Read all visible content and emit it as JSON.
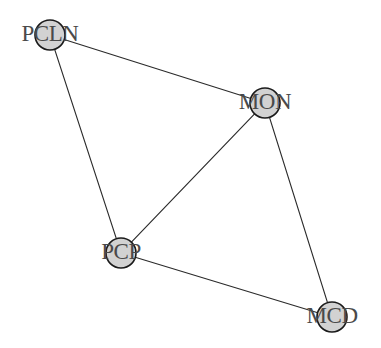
{
  "diagram": {
    "type": "network-graph",
    "title": "",
    "background_color": "#ffffff",
    "node_fill_color": "#d2d2d2",
    "node_stroke_color": "#1a1a1a",
    "edge_color": "#2b2b2b",
    "label_color": "#4a4a4a",
    "node_radius": 15,
    "nodes": [
      {
        "id": "PCLN",
        "label": "PCLN",
        "x": 50,
        "y": 35,
        "r": 15
      },
      {
        "id": "MON",
        "label": "MON",
        "x": 265,
        "y": 103,
        "r": 15
      },
      {
        "id": "PCP",
        "label": "PCP",
        "x": 121,
        "y": 253,
        "r": 15
      },
      {
        "id": "MCD",
        "label": "MCD",
        "x": 332,
        "y": 317,
        "r": 15
      }
    ],
    "edges": [
      {
        "from": "PCLN",
        "to": "MON"
      },
      {
        "from": "PCLN",
        "to": "PCP"
      },
      {
        "from": "MON",
        "to": "PCP"
      },
      {
        "from": "MON",
        "to": "MCD"
      },
      {
        "from": "PCP",
        "to": "MCD"
      }
    ]
  }
}
